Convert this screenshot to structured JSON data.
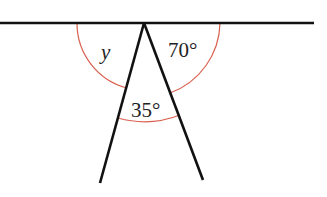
{
  "diagram": {
    "colors": {
      "line": "#111111",
      "arc": "#d9604f",
      "text": "#222222"
    },
    "vertex": {
      "x": 144,
      "y": 23
    },
    "straight_line": {
      "x1": 0,
      "y1": 23,
      "x2": 314,
      "y2": 23
    },
    "left_ray_end": {
      "x": 100,
      "y": 183
    },
    "right_ray_end": {
      "x": 203,
      "y": 180
    },
    "angles": [
      {
        "id": "y",
        "label": "y",
        "value": null,
        "position": "between line (left) and left ray"
      },
      {
        "id": "a70",
        "label": "70°",
        "value": 70,
        "position": "between right ray and line (right)"
      },
      {
        "id": "a35",
        "label": "35°",
        "value": 35,
        "position": "between the two rays"
      }
    ]
  }
}
